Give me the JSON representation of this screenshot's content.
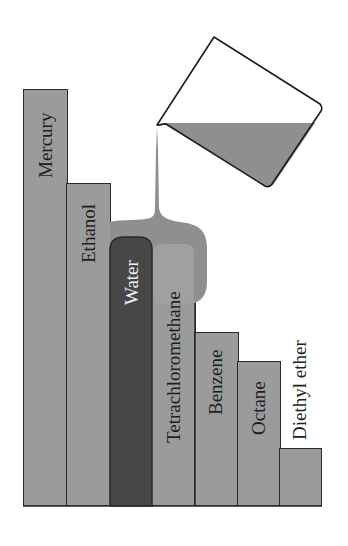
{
  "diagram": {
    "title": "",
    "colors": {
      "bar_fill": "#9b9b9b",
      "water_fill": "#474747",
      "bar_border": "#2a2a2a",
      "liquid_pour": "#8f8f8f",
      "background": "#ffffff"
    },
    "bars": [
      {
        "label": "Mercury",
        "order": 1,
        "relative_height": 416,
        "highlighted": false
      },
      {
        "label": "Ethanol",
        "order": 2,
        "relative_height": 322,
        "highlighted": false
      },
      {
        "label": "Water",
        "order": 3,
        "relative_height": 268,
        "highlighted": true
      },
      {
        "label": "Tetrachloromethane",
        "order": 4,
        "relative_height": 203,
        "highlighted": false
      },
      {
        "label": "Benzene",
        "order": 5,
        "relative_height": 173,
        "highlighted": false
      },
      {
        "label": "Octane",
        "order": 6,
        "relative_height": 144,
        "highlighted": false
      },
      {
        "label": "Diethyl ether",
        "order": 7,
        "relative_height": 57,
        "highlighted": false
      }
    ],
    "beaker": {
      "icon": "beaker-pouring-icon",
      "state": "pouring"
    }
  }
}
